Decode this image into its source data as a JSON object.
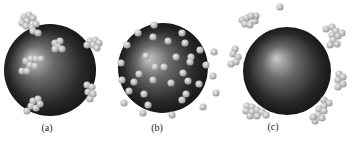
{
  "figure": {
    "width": 354,
    "height": 146,
    "background": "#ffffff",
    "sphere_colors": {
      "highlight": "#c9c9c9",
      "mid": "#6a6a6a",
      "dark": "#2a2a2a",
      "edge": "#141414"
    },
    "particle_colors": {
      "light": "#eeeeee",
      "mid": "#bdbdbd",
      "dark": "#8f8f8f"
    },
    "particle_radius": 3.6
  },
  "panels": [
    {
      "label": "(a)",
      "label_pos": [
        47,
        129
      ],
      "description": "Large sphere with small clusters of particles adsorbed on and around its surface",
      "sphere": {
        "cx": 50,
        "cy": 70,
        "r": 46,
        "highlight": [
          30,
          58
        ]
      },
      "particles": [
        [
          24,
          17
        ],
        [
          29,
          15
        ],
        [
          33,
          18
        ],
        [
          27,
          21
        ],
        [
          22,
          23
        ],
        [
          26,
          26
        ],
        [
          32,
          27
        ],
        [
          36,
          24
        ],
        [
          33,
          31
        ],
        [
          38,
          33
        ],
        [
          55,
          43
        ],
        [
          60,
          41
        ],
        [
          58,
          47
        ],
        [
          62,
          49
        ],
        [
          55,
          49
        ],
        [
          90,
          41
        ],
        [
          95,
          40
        ],
        [
          99,
          43
        ],
        [
          93,
          45
        ],
        [
          97,
          48
        ],
        [
          87,
          45
        ],
        [
          26,
          61
        ],
        [
          31,
          59
        ],
        [
          36,
          59
        ],
        [
          41,
          59
        ],
        [
          30,
          65
        ],
        [
          35,
          66
        ],
        [
          22,
          71
        ],
        [
          27,
          71
        ],
        [
          87,
          85
        ],
        [
          92,
          87
        ],
        [
          88,
          92
        ],
        [
          93,
          94
        ],
        [
          90,
          99
        ],
        [
          33,
          101
        ],
        [
          38,
          99
        ],
        [
          31,
          106
        ],
        [
          36,
          108
        ],
        [
          40,
          104
        ],
        [
          27,
          111
        ]
      ]
    },
    {
      "label": "(b)",
      "label_pos": [
        157,
        129
      ],
      "description": "Large sphere uniformly decorated with many single particles",
      "sphere": {
        "cx": 163,
        "cy": 68,
        "r": 45,
        "highlight": [
          148,
          58
        ]
      },
      "particles": [
        [
          154,
          25
        ],
        [
          138,
          33
        ],
        [
          182,
          33
        ],
        [
          127,
          45
        ],
        [
          153,
          37
        ],
        [
          168,
          41
        ],
        [
          185,
          43
        ],
        [
          191,
          57
        ],
        [
          200,
          50
        ],
        [
          214,
          52
        ],
        [
          146,
          56
        ],
        [
          176,
          57
        ],
        [
          190,
          62
        ],
        [
          206,
          65
        ],
        [
          121,
          63
        ],
        [
          164,
          67
        ],
        [
          183,
          73
        ],
        [
          188,
          81
        ],
        [
          213,
          76
        ],
        [
          122,
          80
        ],
        [
          134,
          82
        ],
        [
          153,
          80
        ],
        [
          171,
          83
        ],
        [
          199,
          84
        ],
        [
          216,
          93
        ],
        [
          129,
          91
        ],
        [
          144,
          94
        ],
        [
          186,
          94
        ],
        [
          182,
          100
        ],
        [
          124,
          103
        ],
        [
          148,
          105
        ],
        [
          203,
          107
        ],
        [
          143,
          113
        ],
        [
          172,
          115
        ],
        [
          155,
          67
        ],
        [
          139,
          74
        ]
      ]
    },
    {
      "label": "(c)",
      "label_pos": [
        273,
        128
      ],
      "description": "Large bare sphere with particle clusters dispersed in the surrounding medium, not adsorbed",
      "sphere": {
        "cx": 287,
        "cy": 71,
        "r": 44,
        "highlight": [
          276,
          58
        ]
      },
      "particles": [
        [
          280,
          7
        ],
        [
          242,
          20
        ],
        [
          247,
          18
        ],
        [
          245,
          24
        ],
        [
          250,
          25
        ],
        [
          255,
          21
        ],
        [
          256,
          16
        ],
        [
          251,
          16
        ],
        [
          235,
          49
        ],
        [
          233,
          54
        ],
        [
          238,
          57
        ],
        [
          236,
          62
        ],
        [
          231,
          64
        ],
        [
          326,
          29
        ],
        [
          332,
          27
        ],
        [
          336,
          31
        ],
        [
          332,
          35
        ],
        [
          338,
          36
        ],
        [
          342,
          33
        ],
        [
          333,
          40
        ],
        [
          337,
          44
        ],
        [
          330,
          45
        ],
        [
          339,
          74
        ],
        [
          343,
          77
        ],
        [
          338,
          80
        ],
        [
          343,
          84
        ],
        [
          338,
          87
        ],
        [
          247,
          106
        ],
        [
          252,
          107
        ],
        [
          246,
          111
        ],
        [
          252,
          112
        ],
        [
          257,
          110
        ],
        [
          262,
          112
        ],
        [
          266,
          115
        ],
        [
          257,
          116
        ],
        [
          250,
          116
        ],
        [
          324,
          100
        ],
        [
          329,
          103
        ],
        [
          324,
          106
        ],
        [
          319,
          109
        ],
        [
          324,
          111
        ],
        [
          318,
          115
        ],
        [
          322,
          118
        ],
        [
          315,
          121
        ],
        [
          313,
          117
        ]
      ]
    }
  ]
}
